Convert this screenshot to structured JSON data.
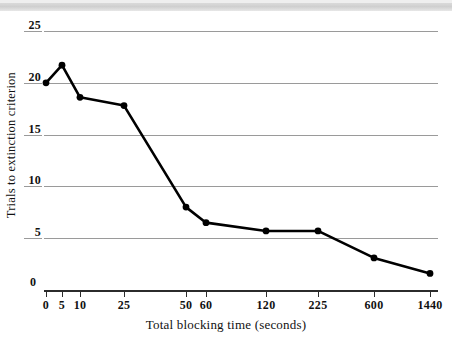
{
  "figure": {
    "background": "#ffffff",
    "ink_color": "#000000",
    "grid_color": "#9a9a9a"
  },
  "chart_data": {
    "type": "line",
    "title": "",
    "xlabel": "Total blocking time (seconds)",
    "ylabel": "Trials to extinction criterion",
    "categories": [
      "0",
      "5",
      "10",
      "25",
      "50",
      "60",
      "120",
      "225",
      "600",
      "1440"
    ],
    "x_tick_labels": [
      "0",
      "5",
      "10",
      "25",
      "50",
      "60",
      "120",
      "225",
      "600",
      "1440"
    ],
    "y_tick_labels": [
      "25",
      "20",
      "15",
      "10",
      "5",
      "0"
    ],
    "y_tick_values": [
      25,
      20,
      15,
      10,
      5,
      0
    ],
    "ylim": [
      0,
      25
    ],
    "grid": "horizontal",
    "legend": "none",
    "series": [
      {
        "name": "Trials to extinction criterion",
        "marker": "filled-circle",
        "values": [
          20.0,
          21.7,
          18.6,
          17.8,
          8.0,
          6.5,
          5.7,
          5.7,
          3.1,
          1.6
        ]
      }
    ],
    "points": [
      {
        "x_label": "0",
        "value": 20.0
      },
      {
        "x_label": "5",
        "value": 21.7
      },
      {
        "x_label": "10",
        "value": 18.6
      },
      {
        "x_label": "25",
        "value": 17.8
      },
      {
        "x_label": "50",
        "value": 8.0
      },
      {
        "x_label": "60",
        "value": 6.5
      },
      {
        "x_label": "120",
        "value": 5.7
      },
      {
        "x_label": "225",
        "value": 5.7
      },
      {
        "x_label": "600",
        "value": 3.1
      },
      {
        "x_label": "1440",
        "value": 1.6
      }
    ],
    "x_pixel_positions": [
      46,
      62,
      80,
      124,
      186,
      206,
      266,
      318,
      374,
      430
    ]
  }
}
